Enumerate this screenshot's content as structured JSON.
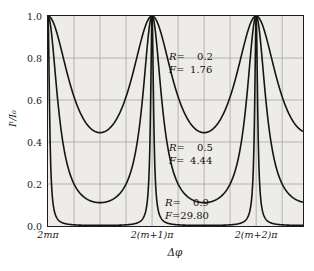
{
  "figure": {
    "background": "#ffffff",
    "plot_background": "#edece8",
    "frame_color": "#1c1c1c",
    "grid_color": "#a6a6a2",
    "curve_color": "#151515",
    "text_color": "#1a1a1a"
  },
  "chart_data": {
    "type": "line",
    "title": "",
    "x_axis": {
      "label": "Δφ",
      "tick_labels": [
        "2mπ",
        "2(m+1)π",
        "2(m+2)π"
      ],
      "tick_positions_periods": [
        0,
        1,
        2
      ],
      "range_periods": [
        0,
        2.45
      ],
      "grid_interval_periods": 0.25
    },
    "y_axis": {
      "label": "Iᵗ/I₀",
      "tick_labels": [
        "1.0",
        "0.8",
        "0.6",
        "0.4",
        "0.2",
        "0.0"
      ],
      "tick_values": [
        1.0,
        0.8,
        0.6,
        0.4,
        0.2,
        0.0
      ],
      "range": [
        0,
        1
      ],
      "grid_values": [
        0.2,
        0.4,
        0.6,
        0.8
      ]
    },
    "formula": "I_t/I_0 = 1 / (1 + (4R/(1-R)^2)·sin^2(Δφ/2))",
    "series": [
      {
        "name": "R=0.2",
        "R": 0.2,
        "F": 1.76,
        "peak": 1.0,
        "min": 0.44
      },
      {
        "name": "R=0.5",
        "R": 0.5,
        "F": 4.44,
        "peak": 1.0,
        "min": 0.11
      },
      {
        "name": "R=0.9",
        "R": 0.9,
        "F": 29.8,
        "peak": 1.0,
        "min": 0.003
      }
    ],
    "annotations": [
      {
        "lines": [
          [
            "R",
            "0.2"
          ],
          [
            "F",
            "1.76"
          ]
        ],
        "x_px": 121,
        "y_px": 35
      },
      {
        "lines": [
          [
            "R",
            "0.5"
          ],
          [
            "F",
            "4.44"
          ]
        ],
        "x_px": 121,
        "y_px": 126
      },
      {
        "lines": [
          [
            "R",
            "0.9"
          ],
          [
            "F",
            "29.80"
          ]
        ],
        "x_px": 117,
        "y_px": 181
      }
    ]
  }
}
